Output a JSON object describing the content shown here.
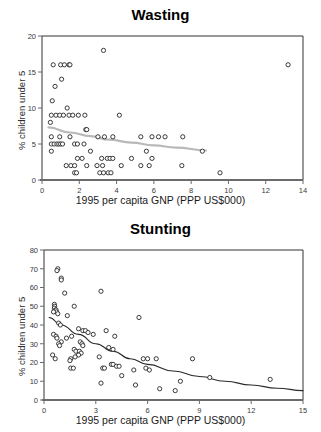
{
  "figure": {
    "panels": [
      "wasting",
      "stunting"
    ]
  },
  "chart_data": [
    {
      "type": "scatter",
      "id": "wasting",
      "title": "Wasting",
      "xlabel": "1995 per capita GNP (PPP US$000)",
      "ylabel": "% children under 5",
      "xlim": [
        0,
        14
      ],
      "ylim": [
        0,
        20
      ],
      "xticks": [
        0,
        2,
        4,
        6,
        8,
        10,
        12,
        14
      ],
      "yticks": [
        0,
        5,
        10,
        15,
        20
      ],
      "grid": false,
      "legend": null,
      "marker": "open-circle",
      "points": [
        [
          0.6,
          16
        ],
        [
          1.0,
          16
        ],
        [
          1.2,
          16
        ],
        [
          1.45,
          16
        ],
        [
          1.5,
          16
        ],
        [
          0.7,
          13
        ],
        [
          1.05,
          14
        ],
        [
          0.55,
          11
        ],
        [
          1.35,
          10
        ],
        [
          0.5,
          9
        ],
        [
          0.75,
          9
        ],
        [
          0.95,
          9
        ],
        [
          1.15,
          9
        ],
        [
          1.45,
          9
        ],
        [
          1.65,
          9
        ],
        [
          1.95,
          9
        ],
        [
          2.3,
          9
        ],
        [
          4.15,
          9
        ],
        [
          0.45,
          8
        ],
        [
          3.3,
          18
        ],
        [
          13.2,
          16
        ],
        [
          0.5,
          6
        ],
        [
          0.95,
          6
        ],
        [
          1.5,
          6
        ],
        [
          2.35,
          7
        ],
        [
          2.4,
          7
        ],
        [
          3.35,
          6
        ],
        [
          3.8,
          6
        ],
        [
          5.3,
          6
        ],
        [
          5.9,
          6
        ],
        [
          6.25,
          6
        ],
        [
          6.6,
          6
        ],
        [
          7.55,
          6
        ],
        [
          3.0,
          6
        ],
        [
          0.5,
          5
        ],
        [
          0.65,
          5
        ],
        [
          0.8,
          5
        ],
        [
          0.9,
          5
        ],
        [
          1.0,
          5
        ],
        [
          1.1,
          5
        ],
        [
          1.75,
          5
        ],
        [
          1.9,
          5
        ],
        [
          2.25,
          5
        ],
        [
          0.5,
          4
        ],
        [
          2.6,
          4
        ],
        [
          5.6,
          4
        ],
        [
          8.6,
          4
        ],
        [
          1.9,
          3
        ],
        [
          2.15,
          3
        ],
        [
          3.2,
          3
        ],
        [
          3.5,
          3
        ],
        [
          3.65,
          3
        ],
        [
          3.8,
          3
        ],
        [
          4.8,
          3
        ],
        [
          5.9,
          3
        ],
        [
          1.3,
          2
        ],
        [
          1.55,
          2
        ],
        [
          1.75,
          2
        ],
        [
          2.4,
          2
        ],
        [
          2.95,
          2
        ],
        [
          3.25,
          2
        ],
        [
          4.25,
          2
        ],
        [
          5.3,
          2
        ],
        [
          5.75,
          2
        ],
        [
          7.5,
          2
        ],
        [
          1.75,
          1
        ],
        [
          1.85,
          1
        ],
        [
          3.1,
          1
        ],
        [
          3.3,
          1
        ],
        [
          3.55,
          1
        ],
        [
          3.7,
          1
        ],
        [
          9.55,
          1
        ]
      ],
      "trendline": {
        "style": "faint-gray-line",
        "color": "#b9b9b9",
        "points": [
          [
            0.35,
            7.3
          ],
          [
            1.5,
            6.6
          ],
          [
            2.6,
            6.1
          ],
          [
            3.6,
            5.6
          ],
          [
            4.8,
            5.2
          ],
          [
            6.0,
            4.8
          ],
          [
            7.2,
            4.5
          ],
          [
            8.8,
            4.1
          ]
        ]
      }
    },
    {
      "type": "scatter",
      "id": "stunting",
      "title": "Stunting",
      "xlabel": "1995 per capita GNP (PPP US$000)",
      "ylabel": "% children under 5",
      "xlim": [
        0,
        15
      ],
      "ylim": [
        0,
        80
      ],
      "xticks": [
        0,
        3,
        6,
        9,
        12,
        15
      ],
      "yticks": [
        0,
        10,
        20,
        30,
        40,
        50,
        60,
        70,
        80
      ],
      "grid": false,
      "legend": null,
      "marker": "open-circle",
      "points": [
        [
          0.8,
          70
        ],
        [
          0.75,
          69
        ],
        [
          1.0,
          65
        ],
        [
          1.0,
          64
        ],
        [
          1.2,
          57
        ],
        [
          3.3,
          58
        ],
        [
          1.75,
          50
        ],
        [
          1.35,
          45
        ],
        [
          5.5,
          44
        ],
        [
          0.6,
          51
        ],
        [
          0.62,
          50
        ],
        [
          0.6,
          49
        ],
        [
          0.65,
          48
        ],
        [
          0.7,
          48
        ],
        [
          0.72,
          47
        ],
        [
          0.8,
          46
        ],
        [
          0.55,
          47
        ],
        [
          0.85,
          41
        ],
        [
          0.95,
          40
        ],
        [
          2.0,
          38
        ],
        [
          2.25,
          37
        ],
        [
          2.4,
          37
        ],
        [
          2.55,
          36
        ],
        [
          3.6,
          37
        ],
        [
          4.1,
          34
        ],
        [
          2.85,
          35
        ],
        [
          0.55,
          35
        ],
        [
          0.7,
          34
        ],
        [
          0.75,
          33
        ],
        [
          1.3,
          33
        ],
        [
          1.0,
          31
        ],
        [
          0.85,
          30
        ],
        [
          0.9,
          29
        ],
        [
          1.6,
          34
        ],
        [
          2.1,
          31
        ],
        [
          2.2,
          30
        ],
        [
          2.25,
          29
        ],
        [
          1.75,
          27
        ],
        [
          1.85,
          26
        ],
        [
          2.05,
          26
        ],
        [
          2.15,
          25
        ],
        [
          2.0,
          24
        ],
        [
          1.8,
          23
        ],
        [
          3.2,
          23
        ],
        [
          3.75,
          28
        ],
        [
          4.0,
          27
        ],
        [
          0.5,
          24
        ],
        [
          0.65,
          22
        ],
        [
          1.55,
          22
        ],
        [
          1.5,
          21
        ],
        [
          5.75,
          22
        ],
        [
          6.0,
          22
        ],
        [
          6.5,
          22
        ],
        [
          8.6,
          22
        ],
        [
          3.4,
          17
        ],
        [
          3.5,
          17
        ],
        [
          3.9,
          19
        ],
        [
          4.0,
          19
        ],
        [
          4.2,
          18
        ],
        [
          4.35,
          18
        ],
        [
          5.2,
          16
        ],
        [
          5.9,
          17
        ],
        [
          6.1,
          16
        ],
        [
          1.55,
          17
        ],
        [
          1.7,
          17
        ],
        [
          3.3,
          9
        ],
        [
          5.3,
          8
        ],
        [
          4.5,
          13
        ],
        [
          6.7,
          6
        ],
        [
          7.6,
          5
        ],
        [
          7.9,
          10
        ],
        [
          9.6,
          12
        ],
        [
          13.1,
          11
        ]
      ],
      "trendline": {
        "style": "solid-dark-curve",
        "color": "#2b2b2b",
        "points": [
          [
            0.3,
            44
          ],
          [
            1.0,
            40
          ],
          [
            2.0,
            35
          ],
          [
            3.0,
            30
          ],
          [
            4.0,
            26
          ],
          [
            5.0,
            22
          ],
          [
            6.0,
            19
          ],
          [
            7.5,
            15.5
          ],
          [
            9.0,
            12.5
          ],
          [
            10.5,
            10
          ],
          [
            12.0,
            8
          ],
          [
            13.5,
            6.3
          ],
          [
            15.0,
            5
          ]
        ]
      }
    }
  ]
}
